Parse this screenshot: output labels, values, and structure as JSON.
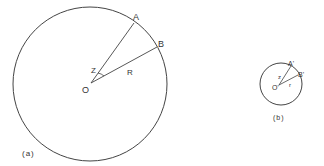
{
  "figure_a": {
    "caption": "(a)",
    "center_label": "O",
    "point_a_label": "A",
    "point_b_label": "B",
    "angle_label": "Z",
    "radius_label": "R"
  },
  "figure_b": {
    "caption": "(b)",
    "center_label": "O'",
    "point_a_label": "A'",
    "point_b_label": "B'",
    "angle_label": "z",
    "radius_label": "r"
  },
  "colors": {
    "stroke": "#444444",
    "text": "#333333",
    "background": "#ffffff"
  }
}
